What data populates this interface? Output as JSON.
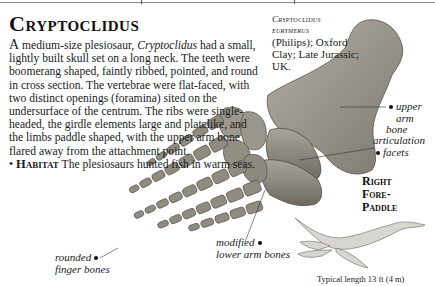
{
  "page": {
    "title": "Cryptoclidus",
    "body": {
      "lead_letter": "A",
      "intro": " medium-size plesiosaur, ",
      "genus": "Cryptoclidus",
      "rest": " had a small, lightly built skull set on a long neck. The teeth were boomerang shaped, faintly ribbed, pointed, and round in cross section. The vertebrae were flat-faced, with two distinct openings (foramina) sited on the undersurface of the centrum. The ribs were single-headed, the girdle elements large and platelike, and the limbs paddle shaped, with the upper arm bone flared away from the attachment point.",
      "habitat_bullet": "•",
      "habitat_label": "Habitat",
      "habitat_text": " The plesiosaurs hunted fish in warm seas."
    },
    "specimen_caption": {
      "species_line1": "Cryptoclidus",
      "species_line2": "eurymerus",
      "details": "(Philips); Oxford Clay; Late Jurassic; UK."
    },
    "labels": {
      "upper_arm_line1": "upper",
      "upper_arm_line2": "arm bone",
      "articulation_line1": "articulation",
      "articulation_line2": "facets",
      "lower_arm_line1": "modified",
      "lower_arm_line2": "lower arm bones",
      "finger_line1": "rounded",
      "finger_line2": "finger bones"
    },
    "paddle_title": {
      "line1": "Right",
      "line2": "Fore-",
      "line3": "Paddle"
    },
    "typical_length": "Typical length 13 ft (4 m)"
  },
  "colors": {
    "bone_light": "#a8a49c",
    "bone_dark": "#6f6a62",
    "text": "#1a1a1a"
  }
}
